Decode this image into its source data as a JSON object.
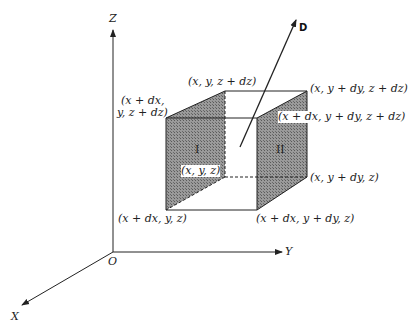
{
  "axes": {
    "z_label": "Z",
    "y_label": "Y",
    "x_label": "X",
    "origin_label": "O"
  },
  "vector": {
    "label": "D"
  },
  "faces": {
    "face_1": "I",
    "face_2": "II"
  },
  "vertices": {
    "x_y_z": "(x, y, z)",
    "x_y_zdz": "(x, y, z + dz)",
    "x_ydy_zdz": "(x, y + dy, z + dz)",
    "xdx_ydy_zdz": "(x + dx, y + dy, z + dz)",
    "xdx_y_zdz_line1": "(x + dx,",
    "xdx_y_zdz_line2": "y, z + dz)",
    "x_ydy_z": "(x, y + dy, z)",
    "xdx_y_z": "(x + dx, y, z)",
    "xdx_ydy_z": "(x + dx, y + dy, z)"
  },
  "colors": {
    "line": "#222222",
    "shade": "#8c8c8c",
    "background": "#ffffff"
  }
}
